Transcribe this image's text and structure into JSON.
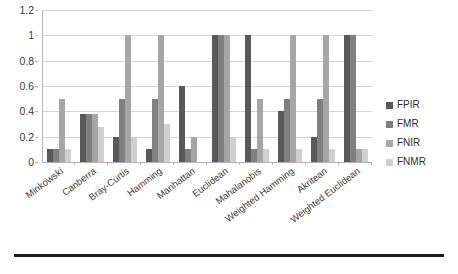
{
  "chart_data": {
    "type": "bar",
    "title": "",
    "subtitle": "",
    "xlabel": "",
    "ylabel": "",
    "ylim": [
      0,
      1.2
    ],
    "grid": true,
    "legend_position": "right",
    "y_ticks": [
      "0",
      "0.2",
      "0.4",
      "0.6",
      "0.8",
      "1",
      "1.2"
    ],
    "y_tick_values": [
      0,
      0.2,
      0.4,
      0.6,
      0.8,
      1,
      1.2
    ],
    "categories": [
      "Minkowski",
      "Canberra",
      "Bray-Curtis",
      "Hamming",
      "Manhattan",
      "Euclidean",
      "Mahalanobis",
      "Weighted Hamming",
      "Akritean",
      "Weighted Euclidean"
    ],
    "series": [
      {
        "name": "FPIR",
        "color": "#595959",
        "values": [
          0.1,
          0.38,
          0.2,
          0.1,
          0.6,
          1.0,
          1.0,
          0.4,
          0.2,
          1.0
        ]
      },
      {
        "name": "FMR",
        "color": "#808080",
        "values": [
          0.1,
          0.38,
          0.5,
          0.5,
          0.1,
          1.0,
          0.1,
          0.5,
          0.5,
          1.0
        ]
      },
      {
        "name": "FNIR",
        "color": "#a6a6a6",
        "values": [
          0.5,
          0.38,
          1.0,
          1.0,
          0.2,
          1.0,
          0.5,
          1.0,
          1.0,
          0.1
        ]
      },
      {
        "name": "FNMR",
        "color": "#d0d0d0",
        "values": [
          0.1,
          0.28,
          0.2,
          0.3,
          0.0,
          0.2,
          0.1,
          0.1,
          0.1,
          0.1
        ]
      }
    ]
  }
}
